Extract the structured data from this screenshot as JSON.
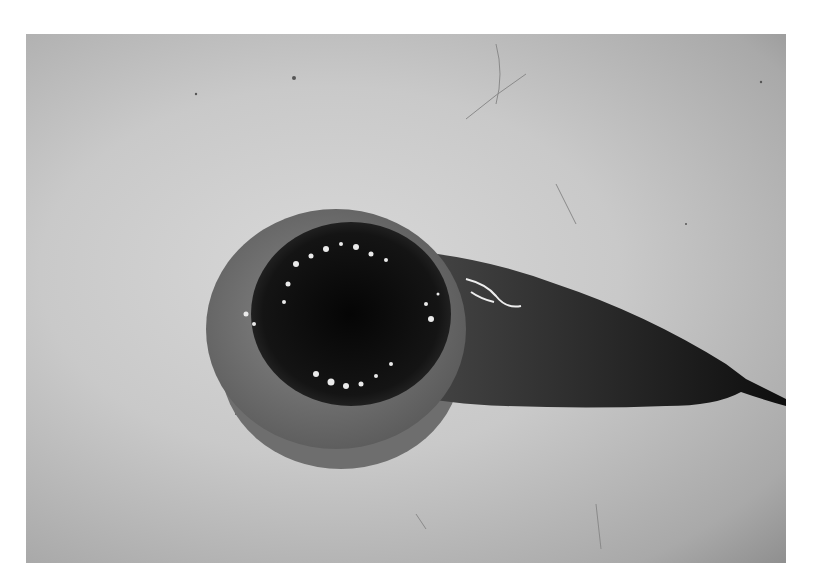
{
  "image": {
    "description": "Grayscale photograph of a dissected specimen: a round dark mass with a lighter rim and a tapering dark elongated extension, lying on a light gray mottled surface",
    "colors": {
      "page_background": "#ffffff",
      "surface_light": "#d8d8d8",
      "surface_dark": "#8f8f8f",
      "specimen_rim": "#7a7a7a",
      "specimen_core": "#101010",
      "highlights": "#f0f0f0"
    }
  }
}
